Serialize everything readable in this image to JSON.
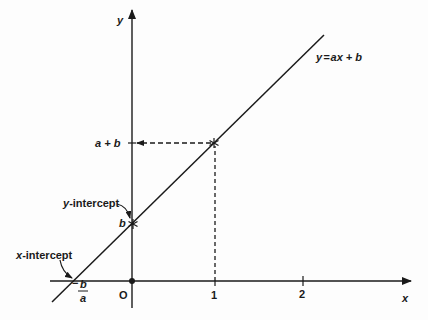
{
  "diagram": {
    "colors": {
      "stroke": "#1a1a1a",
      "background": "#fdfdfd"
    },
    "axes": {
      "x_label": "x",
      "y_label": "y",
      "origin_label": "O",
      "x_ticks": [
        "1",
        "2"
      ]
    },
    "line": {
      "equation_label": "y = ax + b",
      "equation_parts": {
        "lhs": "y",
        "eq": "=",
        "rhs": "ax + b"
      }
    },
    "annotations": {
      "y_intercept_label": "y-intercept",
      "y_intercept_prefix": "y",
      "y_intercept_suffix": "-intercept",
      "x_intercept_label": "x-intercept",
      "x_intercept_prefix": "x",
      "x_intercept_suffix": "-intercept",
      "b_label": "b",
      "a_plus_b_label": "a + b",
      "neg_b_over_a": {
        "sign": "−",
        "numerator": "b",
        "denominator": "a"
      }
    }
  }
}
